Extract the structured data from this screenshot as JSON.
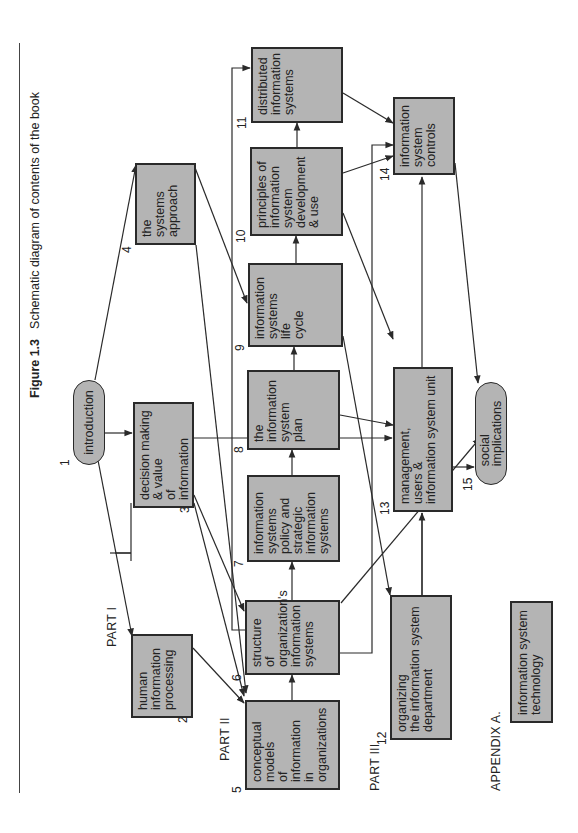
{
  "figure": {
    "number": "Figure 1.3",
    "title": "Schematic diagram of contents of the book"
  },
  "parts": {
    "part1": "PART I",
    "part2": "PART II",
    "part3": "PART  III",
    "appendix": "APPENDIX  A."
  },
  "nodes": [
    {
      "id": 1,
      "num": "1",
      "label": "introduction",
      "shape": "pill"
    },
    {
      "id": 2,
      "num": "2",
      "label": "human\ninformation\nprocessing",
      "shape": "box"
    },
    {
      "id": 3,
      "num": "3",
      "label": "decision making\n& value\nof\ninformation",
      "shape": "box"
    },
    {
      "id": 4,
      "num": "4",
      "label": "the systems\napproach",
      "shape": "box"
    },
    {
      "id": 5,
      "num": "5",
      "label": "conceptual\nmodels\nof\ninformation\nin\norganizations",
      "shape": "box"
    },
    {
      "id": 6,
      "num": "6",
      "label": "structure of\norganization's\ninformation\nsystems",
      "shape": "box"
    },
    {
      "id": 7,
      "num": "7",
      "label": "information\nsystems\npolicy and\nstrategic\ninformation\nsystems",
      "shape": "box"
    },
    {
      "id": 8,
      "num": "8",
      "label": "the\ninformation\nsystem\nplan",
      "shape": "box"
    },
    {
      "id": 9,
      "num": "9",
      "label": "information\nsystems\nlife\ncycle",
      "shape": "box"
    },
    {
      "id": 10,
      "num": "10",
      "label": "principles of\ninformation\nsystem\ndevelopment\n& use",
      "shape": "box"
    },
    {
      "id": 11,
      "num": "11",
      "label": "distributed\ninformation\nsystems",
      "shape": "box"
    },
    {
      "id": 12,
      "num": "12",
      "label": "organizing\nthe information system\ndepartment",
      "shape": "box"
    },
    {
      "id": 13,
      "num": "13",
      "label": "management,\nusers &\ninformation system unit",
      "shape": "box"
    },
    {
      "id": 14,
      "num": "14",
      "label": "information\nsystem\ncontrols",
      "shape": "box"
    },
    {
      "id": 15,
      "num": "15",
      "label": "social\nimplications",
      "shape": "pill"
    },
    {
      "id": "A",
      "num": "",
      "label": "information system\ntechnology",
      "shape": "box"
    }
  ],
  "edges": [
    [
      1,
      2
    ],
    [
      1,
      3
    ],
    [
      1,
      4
    ],
    [
      2,
      3
    ],
    [
      2,
      5
    ],
    [
      3,
      5
    ],
    [
      3,
      6
    ],
    [
      3,
      13
    ],
    [
      4,
      5
    ],
    [
      4,
      9
    ],
    [
      5,
      6
    ],
    [
      6,
      7
    ],
    [
      6,
      11
    ],
    [
      6,
      14
    ],
    [
      6,
      15
    ],
    [
      7,
      8
    ],
    [
      8,
      9
    ],
    [
      8,
      13
    ],
    [
      9,
      10
    ],
    [
      9,
      12
    ],
    [
      10,
      11
    ],
    [
      10,
      13
    ],
    [
      10,
      14
    ],
    [
      11,
      14
    ],
    [
      12,
      13
    ],
    [
      13,
      14
    ],
    [
      13,
      15
    ],
    [
      14,
      15
    ]
  ],
  "colors": {
    "box_fill": "#b4b4b4",
    "box_border": "#2a2a2a",
    "line": "#2a2a2a",
    "background": "#ffffff"
  }
}
